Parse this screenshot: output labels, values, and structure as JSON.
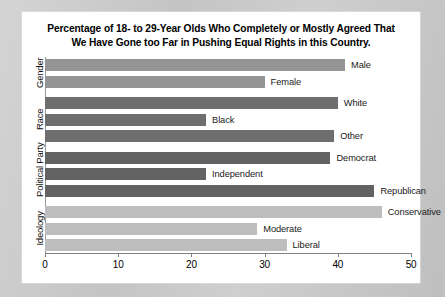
{
  "chart_data": {
    "type": "bar",
    "orientation": "horizontal",
    "title": "Percentage of 18- to 29-Year Olds Who Completely or Mostly Agreed That We Have Gone too Far in Pushing Equal Rights in this Country.",
    "title_line1": "Percentage of 18- to 29-Year Olds Who Completely or Mostly Agreed That",
    "title_line2": "We Have Gone too Far in Pushing Equal Rights in this Country.",
    "xlabel": "",
    "ylabel": "",
    "xlim": [
      0,
      50
    ],
    "xticks": [
      0,
      10,
      20,
      30,
      40,
      50
    ],
    "xtick_labels": [
      "0",
      "10",
      "20",
      "30",
      "40",
      "50"
    ],
    "grid": false,
    "legend": false,
    "categories": [
      "Male",
      "Female",
      "White",
      "Black",
      "Other",
      "Democrat",
      "Independent",
      "Republican",
      "Conservative",
      "Moderate",
      "Liberal"
    ],
    "values": [
      41,
      30,
      40,
      22,
      39.5,
      39,
      22,
      45,
      46,
      29,
      33
    ],
    "groups": [
      {
        "name": "Gender",
        "color": "#949494",
        "bars": [
          {
            "label": "Male",
            "value": 41
          },
          {
            "label": "Female",
            "value": 30
          }
        ]
      },
      {
        "name": "Race",
        "color": "#6e6e6e",
        "bars": [
          {
            "label": "White",
            "value": 40
          },
          {
            "label": "Black",
            "value": 22
          },
          {
            "label": "Other",
            "value": 39.5
          }
        ]
      },
      {
        "name": "Political Party",
        "color": "#636363",
        "bars": [
          {
            "label": "Democrat",
            "value": 39
          },
          {
            "label": "Independent",
            "value": 22
          },
          {
            "label": "Republican",
            "value": 45
          }
        ]
      },
      {
        "name": "Ideology",
        "color": "#bdbdbd",
        "bars": [
          {
            "label": "Conservative",
            "value": 46
          },
          {
            "label": "Moderate",
            "value": 29
          },
          {
            "label": "Liberal",
            "value": 33
          }
        ]
      }
    ]
  },
  "colors": {
    "page_background": "#c9c9c9",
    "panel_background": "#ffffff",
    "axis": "#808080",
    "text": "#000000"
  }
}
